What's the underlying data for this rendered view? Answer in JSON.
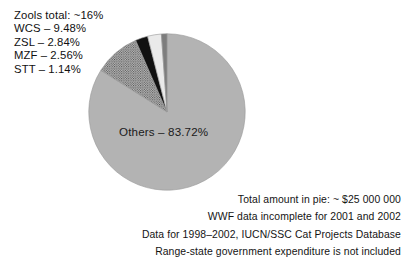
{
  "legend": {
    "lines": [
      "Zools total: ~16%",
      "WCS – 9.48%",
      "ZSL – 2.84%",
      "MZF – 2.56%",
      "STT – 1.14%"
    ]
  },
  "pie": {
    "center_label": "Others – 83.72%"
  },
  "footnotes": {
    "lines": [
      "Total amount in pie: ~ $25 000 000",
      "WWF data incomplete for 2001 and 2002",
      "Data for 1998–2002, IUCN/SSC Cat Projects Database",
      "Range-state government expenditure is not included"
    ]
  },
  "colors": {
    "others": "#b3b3b3",
    "wcs_stipple_bg": "#b8b8b8",
    "wcs_stipple_dot": "#4a4a4a",
    "zsl": "#eaeaea",
    "mzf": "#111111",
    "stt": "#7d7d7d",
    "outline": "#9a9a9a",
    "background": "#ffffff",
    "text": "#111111"
  },
  "chart_data": {
    "type": "pie",
    "title": "",
    "subtitle": "",
    "xlabel": "",
    "ylabel": "",
    "legend_position": "top-left",
    "grid": false,
    "units": "percent",
    "start_angle_deg": 0,
    "direction": "clockwise",
    "total_amount_usd": 25000000,
    "categories": [
      "Others",
      "WCS",
      "ZSL",
      "MZF",
      "STT"
    ],
    "values": [
      83.72,
      9.48,
      2.84,
      2.56,
      1.14
    ],
    "slices": [
      {
        "name": "Others",
        "label": "Others – 83.72%",
        "value": 83.72,
        "fill": "#b3b3b3",
        "pattern": "solid",
        "label_placement": "inside"
      },
      {
        "name": "WCS",
        "label": "WCS – 9.48%",
        "value": 9.48,
        "fill": "#b8b8b8",
        "pattern": "stipple",
        "label_placement": "legend"
      },
      {
        "name": "MZF",
        "label": "MZF – 2.56%",
        "value": 2.56,
        "fill": "#111111",
        "pattern": "solid",
        "label_placement": "legend"
      },
      {
        "name": "ZSL",
        "label": "ZSL – 2.84%",
        "value": 2.84,
        "fill": "#eaeaea",
        "pattern": "solid",
        "label_placement": "legend"
      },
      {
        "name": "STT",
        "label": "STT – 1.14%",
        "value": 1.14,
        "fill": "#7d7d7d",
        "pattern": "solid",
        "label_placement": "legend"
      }
    ],
    "annotations": [
      "Zools total: ~16%",
      "Total amount in pie: ~ $25 000 000",
      "WWF data incomplete for 2001 and 2002",
      "Data for 1998–2002, IUCN/SSC Cat Projects Database",
      "Range-state government expenditure is not included"
    ]
  }
}
